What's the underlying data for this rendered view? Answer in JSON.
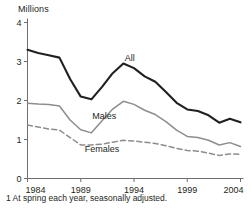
{
  "chart_data": {
    "type": "line",
    "title": "",
    "subtitle": "",
    "ylabel": "Millions",
    "xlabel": "",
    "footnote": "1 At spring each year, seasonally adjusted.",
    "ylim": [
      0,
      4
    ],
    "xlim": [
      1984,
      2004
    ],
    "grid": false,
    "legend_position": "inline-annotation",
    "yticks": [
      "0",
      "1",
      "2",
      "3",
      "4"
    ],
    "ytick_values": [
      0,
      1,
      2,
      3,
      4
    ],
    "xticks": [
      "1984",
      "1989",
      "1994",
      "1999",
      "2004"
    ],
    "xtick_values": [
      1984,
      1989,
      1994,
      1999,
      2004
    ],
    "x": [
      1984,
      1985,
      1986,
      1987,
      1988,
      1989,
      1990,
      1991,
      1992,
      1993,
      1994,
      1995,
      1996,
      1997,
      1998,
      1999,
      2000,
      2001,
      2002,
      2003,
      2004
    ],
    "series": [
      {
        "name": "All",
        "style": "solid",
        "color": "#231f20",
        "width": 2.1,
        "label_x": 1993.6,
        "label_y": 3.02,
        "values": [
          3.3,
          3.22,
          3.16,
          3.1,
          2.55,
          2.1,
          2.03,
          2.35,
          2.7,
          2.95,
          2.83,
          2.62,
          2.48,
          2.22,
          1.94,
          1.77,
          1.73,
          1.62,
          1.43,
          1.53,
          1.44
        ]
      },
      {
        "name": "Males",
        "style": "solid",
        "color": "#8d8d8d",
        "width": 1.5,
        "label_x": 1991.2,
        "label_y": 1.52,
        "values": [
          1.93,
          1.91,
          1.9,
          1.86,
          1.5,
          1.25,
          1.17,
          1.48,
          1.78,
          1.98,
          1.9,
          1.75,
          1.64,
          1.46,
          1.24,
          1.08,
          1.05,
          0.98,
          0.86,
          0.92,
          0.82
        ]
      },
      {
        "name": "Females",
        "style": "dashed",
        "color": "#8d8d8d",
        "width": 1.5,
        "label_x": 1991.0,
        "label_y": 0.68,
        "values": [
          1.37,
          1.32,
          1.27,
          1.24,
          1.05,
          0.86,
          0.86,
          0.88,
          0.93,
          0.98,
          0.96,
          0.93,
          0.9,
          0.84,
          0.77,
          0.72,
          0.7,
          0.65,
          0.59,
          0.63,
          0.62
        ]
      }
    ]
  }
}
